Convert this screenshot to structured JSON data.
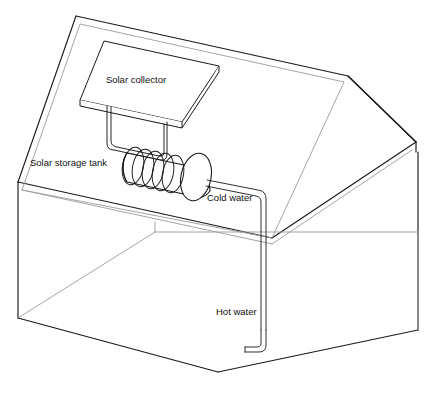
{
  "diagram": {
    "type": "line-drawing",
    "background_color": "#ffffff",
    "line_color": "#1a1a1a",
    "faint_line_color": "#9a9a9a",
    "labels": {
      "solar_collector": "Solar collector",
      "solar_storage_tank": "Solar storage tank",
      "cold_water": "Cold water",
      "hot_water": "Hot water"
    },
    "components": [
      {
        "id": "house-shell",
        "name": "House outline",
        "description": "Open box house with pitched roof drawn in perspective"
      },
      {
        "id": "roof-plane",
        "name": "Roof plane",
        "description": "Slanted parallelogram roof surface facing viewer"
      },
      {
        "id": "solar-collector-panel",
        "name": "Solar collector panel",
        "description": "Flat rectangular panel mounted on roof"
      },
      {
        "id": "collector-support",
        "name": "Collector support pipes",
        "description": "Double-line bracket connecting collector to tank"
      },
      {
        "id": "storage-tank",
        "name": "Solar storage tank",
        "description": "Horizontal cylinder with elliptical end cap"
      },
      {
        "id": "heat-exchanger-coil",
        "name": "Heat exchanger coil",
        "description": "Helical coil of about 5 turns inside tank"
      },
      {
        "id": "cold-water-pipe",
        "name": "Cold water pipe",
        "description": "Pipe running right from tank then down interior wall"
      },
      {
        "id": "hot-water-pipe",
        "name": "Hot water pipe",
        "description": "Pipe running down and terminating in outlet near floor"
      }
    ]
  }
}
